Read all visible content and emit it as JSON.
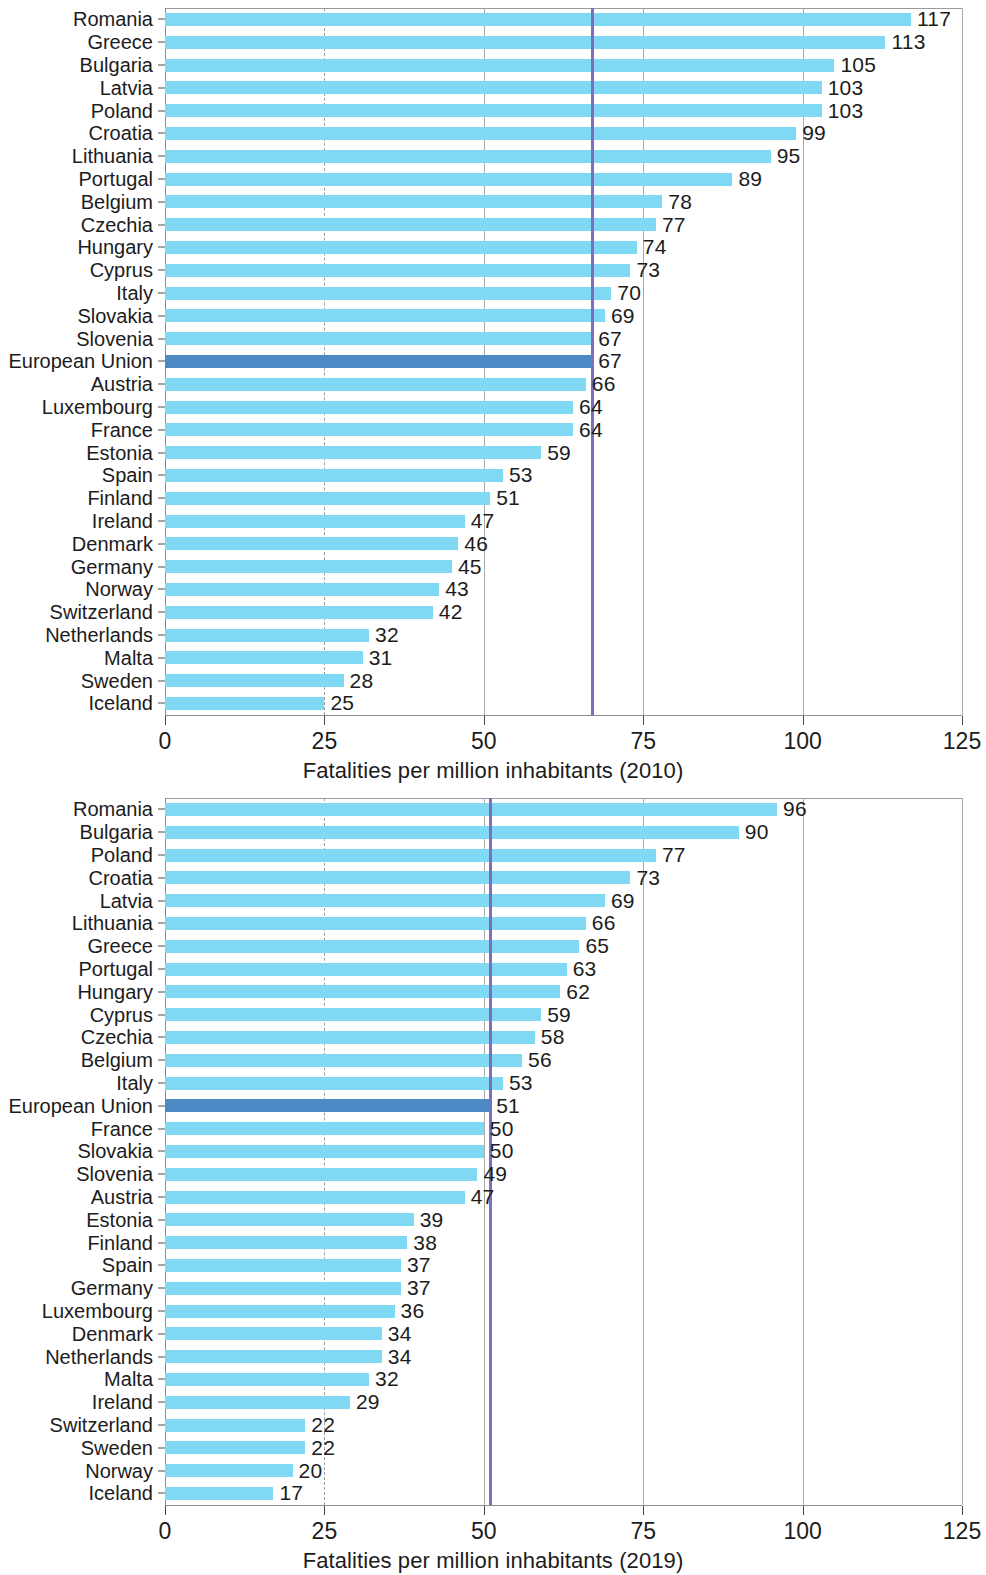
{
  "figure": {
    "background": "#ffffff",
    "bar_color": "#7fd9f5",
    "highlight_color": "#4b8ac4",
    "reference_line_color": "#7d6fbe",
    "highlight_category": "European Union"
  },
  "chart_data": [
    {
      "type": "bar",
      "orientation": "horizontal",
      "title": "",
      "xlabel": "Fatalities per million inhabitants (2010)",
      "ylabel": "",
      "xlim": [
        0,
        125
      ],
      "xticks": [
        0,
        25,
        50,
        75,
        100,
        125
      ],
      "xtick_labels": [
        "0",
        "25",
        "50",
        "75",
        "100",
        "125"
      ],
      "grid": "vertical gridlines at 25 (dashed), 50, 75, 100, 125 (solid)",
      "legend": "none",
      "highlight": {
        "category": "European Union",
        "value": 67
      },
      "reference_line": {
        "value": 67,
        "color": "#7d6fbe"
      },
      "categories": [
        "Romania",
        "Greece",
        "Bulgaria",
        "Latvia",
        "Poland",
        "Croatia",
        "Lithuania",
        "Portugal",
        "Belgium",
        "Czechia",
        "Hungary",
        "Cyprus",
        "Italy",
        "Slovakia",
        "Slovenia",
        "European Union",
        "Austria",
        "Luxembourg",
        "France",
        "Estonia",
        "Spain",
        "Finland",
        "Ireland",
        "Denmark",
        "Germany",
        "Norway",
        "Switzerland",
        "Netherlands",
        "Malta",
        "Sweden",
        "Iceland"
      ],
      "values": [
        117,
        113,
        105,
        103,
        103,
        99,
        95,
        89,
        78,
        77,
        74,
        73,
        70,
        69,
        67,
        67,
        66,
        64,
        64,
        59,
        53,
        51,
        47,
        46,
        45,
        43,
        42,
        32,
        31,
        28,
        25
      ]
    },
    {
      "type": "bar",
      "orientation": "horizontal",
      "title": "",
      "xlabel": "Fatalities per million inhabitants (2019)",
      "ylabel": "",
      "xlim": [
        0,
        125
      ],
      "xticks": [
        0,
        25,
        50,
        75,
        100,
        125
      ],
      "xtick_labels": [
        "0",
        "25",
        "50",
        "75",
        "100",
        "125"
      ],
      "grid": "vertical gridlines at 25 (dashed), 50, 75, 100, 125 (solid)",
      "legend": "none",
      "highlight": {
        "category": "European Union",
        "value": 51
      },
      "reference_line": {
        "value": 51,
        "color": "#7d6fbe"
      },
      "categories": [
        "Romania",
        "Bulgaria",
        "Poland",
        "Croatia",
        "Latvia",
        "Lithuania",
        "Greece",
        "Portugal",
        "Hungary",
        "Cyprus",
        "Czechia",
        "Belgium",
        "Italy",
        "European Union",
        "France",
        "Slovakia",
        "Slovenia",
        "Austria",
        "Estonia",
        "Finland",
        "Spain",
        "Germany",
        "Luxembourg",
        "Denmark",
        "Netherlands",
        "Malta",
        "Ireland",
        "Switzerland",
        "Sweden",
        "Norway",
        "Iceland"
      ],
      "values": [
        96,
        90,
        77,
        73,
        69,
        66,
        65,
        63,
        62,
        59,
        58,
        56,
        53,
        51,
        50,
        50,
        49,
        47,
        39,
        38,
        37,
        37,
        36,
        34,
        34,
        32,
        29,
        22,
        22,
        20,
        17
      ]
    }
  ]
}
